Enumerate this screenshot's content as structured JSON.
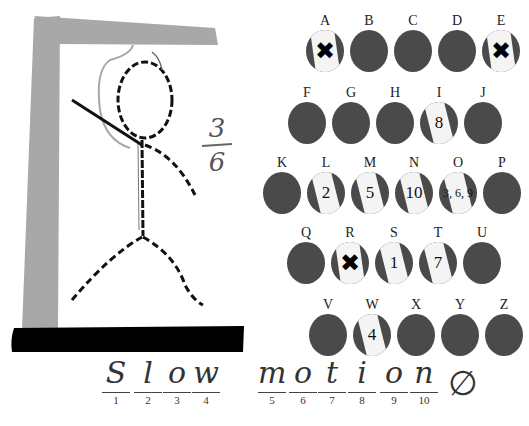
{
  "game": {
    "type": "hangman",
    "colors": {
      "gallows_post": "#a8a8a8",
      "gallows_base": "#000000",
      "bubble_unused": "#4a4a4a",
      "bubble_scratched": "#f4f4f4"
    }
  },
  "score": {
    "wrong": "3",
    "total": "6"
  },
  "alphabet": [
    {
      "letter": "A",
      "state": "miss",
      "value": "✖"
    },
    {
      "letter": "B",
      "state": "unused",
      "value": ""
    },
    {
      "letter": "C",
      "state": "unused",
      "value": ""
    },
    {
      "letter": "D",
      "state": "unused",
      "value": ""
    },
    {
      "letter": "E",
      "state": "miss",
      "value": "✖"
    },
    {
      "letter": "F",
      "state": "unused",
      "value": ""
    },
    {
      "letter": "G",
      "state": "unused",
      "value": ""
    },
    {
      "letter": "H",
      "state": "unused",
      "value": ""
    },
    {
      "letter": "I",
      "state": "hit",
      "value": "8"
    },
    {
      "letter": "J",
      "state": "unused",
      "value": ""
    },
    {
      "letter": "K",
      "state": "unused",
      "value": ""
    },
    {
      "letter": "L",
      "state": "hit",
      "value": "2"
    },
    {
      "letter": "M",
      "state": "hit",
      "value": "5"
    },
    {
      "letter": "N",
      "state": "hit",
      "value": "10"
    },
    {
      "letter": "O",
      "state": "hit",
      "value": "3, 6, 9"
    },
    {
      "letter": "P",
      "state": "unused",
      "value": ""
    },
    {
      "letter": "Q",
      "state": "unused",
      "value": ""
    },
    {
      "letter": "R",
      "state": "miss",
      "value": "✖"
    },
    {
      "letter": "S",
      "state": "hit",
      "value": "1"
    },
    {
      "letter": "T",
      "state": "hit",
      "value": "7"
    },
    {
      "letter": "U",
      "state": "unused",
      "value": ""
    },
    {
      "letter": "V",
      "state": "unused",
      "value": ""
    },
    {
      "letter": "W",
      "state": "hit",
      "value": "4"
    },
    {
      "letter": "X",
      "state": "unused",
      "value": ""
    },
    {
      "letter": "Y",
      "state": "unused",
      "value": ""
    },
    {
      "letter": "Z",
      "state": "unused",
      "value": ""
    }
  ],
  "puzzle": {
    "answer_display": "Slow motion",
    "slots": [
      {
        "glyph": "S",
        "num": "1"
      },
      {
        "glyph": "l",
        "num": "2"
      },
      {
        "glyph": "o",
        "num": "3"
      },
      {
        "glyph": "w",
        "num": "4"
      },
      {
        "glyph": "m",
        "num": "5"
      },
      {
        "glyph": "o",
        "num": "6"
      },
      {
        "glyph": "t",
        "num": "7"
      },
      {
        "glyph": "i",
        "num": "8"
      },
      {
        "glyph": "o",
        "num": "9"
      },
      {
        "glyph": "n",
        "num": "10"
      }
    ],
    "trailing_mark": "∅"
  }
}
